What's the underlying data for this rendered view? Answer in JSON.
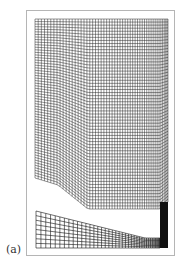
{
  "figure": {
    "panel_label": "(a)",
    "colors": {
      "mesh_line": "#111111",
      "frame": "#b5b5b5",
      "background": "#ffffff"
    },
    "upper_mesh": {
      "columns": 52,
      "rows": 62,
      "left_x": 35,
      "right_x": 168,
      "top_y": 19,
      "bottom_profile": [
        [
          35,
          178
        ],
        [
          58,
          185
        ],
        [
          88,
          209
        ],
        [
          160,
          209
        ],
        [
          168,
          202
        ]
      ]
    },
    "lower_mesh": {
      "columns": 40,
      "rows": 8,
      "left_x": 36,
      "right_x": 160,
      "bottom_y": 248,
      "top_profile": [
        [
          36,
          211
        ],
        [
          145,
          238
        ],
        [
          160,
          238
        ]
      ]
    },
    "dense_column": {
      "x": 160,
      "width": 8,
      "top_y": 202,
      "bottom_y": 248
    }
  }
}
